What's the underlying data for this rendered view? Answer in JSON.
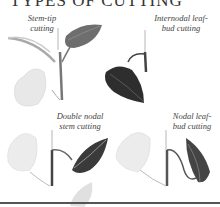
{
  "title": "TYPES OF CUTTING",
  "labels": {
    "stem_tip_1": "Stem-tip",
    "stem_tip_2": "cutting",
    "internodal_1": "Internodal leaf-",
    "internodal_2": "bud cutting",
    "double_1": "Double nodal",
    "double_2": "stem cutting",
    "nodal_1": "Nodal leaf-",
    "nodal_2": "bud cutting"
  },
  "colors": {
    "text": "#444444",
    "dark_leaf": "#3a3a3a",
    "light_leaf": "#e6e6e6",
    "stem": "#555555",
    "rule": "#555555"
  }
}
